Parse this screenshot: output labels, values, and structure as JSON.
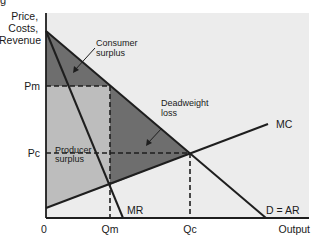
{
  "figure_fragment": "g",
  "colors": {
    "plot_bg": "#ececec",
    "consumer_surplus": "#6e6e6e",
    "deadweight_loss": "#6e6e6e",
    "producer_surplus": "#bdbdbd",
    "line": "#1e1e1e"
  },
  "axes": {
    "y_label_lines": [
      "Price,",
      "Costs,",
      "Revenue"
    ],
    "x_label": "Output",
    "origin": "0",
    "y_ticks": [
      {
        "label": "Pm",
        "y": 86
      },
      {
        "label": "Pc",
        "y": 153
      }
    ],
    "x_ticks": [
      {
        "label": "Qm",
        "x": 110
      },
      {
        "label": "Qc",
        "x": 190
      }
    ]
  },
  "curves": {
    "demand": {
      "label": "D = AR",
      "from": [
        46,
        31
      ],
      "to": [
        266,
        218
      ]
    },
    "mr": {
      "label": "MR",
      "from": [
        46,
        31
      ],
      "to": [
        123,
        218
      ]
    },
    "mc": {
      "label": "MC",
      "from": [
        46,
        208
      ],
      "to": [
        268,
        124
      ]
    }
  },
  "areas": {
    "consumer_surplus": {
      "label_lines": [
        "Consumer",
        "surplus"
      ]
    },
    "producer_surplus": {
      "label_lines": [
        "Producer",
        "surplus"
      ]
    },
    "deadweight_loss": {
      "label_lines": [
        "Deadweight",
        "loss"
      ]
    }
  }
}
